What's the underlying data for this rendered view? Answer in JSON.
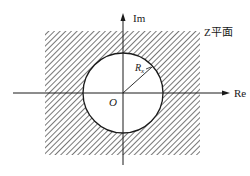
{
  "diagram": {
    "title": "Z平面",
    "axes": {
      "x_label": "Re",
      "y_label": "Im",
      "origin_label": "O"
    },
    "circle": {
      "radius_label_main": "R",
      "radius_label_sub": "x"
    },
    "colors": {
      "line": "#1a1a1a",
      "hatch": "#555555",
      "background": "#ffffff"
    }
  }
}
